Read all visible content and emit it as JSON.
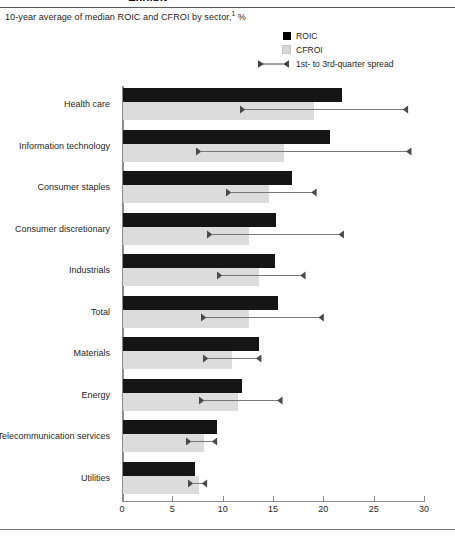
{
  "header": {
    "clipped_title": "Exhibit",
    "subtitle_text": "10-year average of median ROIC and CFROI by sector,",
    "subtitle_footnote": "1",
    "subtitle_unit": "%"
  },
  "legend": {
    "items": [
      {
        "label": "ROIC",
        "type": "swatch",
        "color": "#000000"
      },
      {
        "label": "CFROI",
        "type": "swatch",
        "color": "#d8d8d8"
      },
      {
        "label": "1st- to 3rd-quarter spread",
        "type": "spread"
      }
    ]
  },
  "axis": {
    "ticks": [
      "0",
      "5",
      "10",
      "15",
      "20",
      "25",
      "30"
    ]
  },
  "chart_data": {
    "type": "bar",
    "xlabel": "%",
    "ylabel": "",
    "xlim": [
      0,
      30
    ],
    "orientation": "horizontal",
    "grid": false,
    "legend_position": "top-right",
    "categories": [
      "Health care",
      "Information technology",
      "Consumer staples",
      "Consumer discretionary",
      "Industrials",
      "Total",
      "Materials",
      "Energy",
      "Telecommunication services",
      "Utilities"
    ],
    "series": [
      {
        "name": "ROIC",
        "color": "#151515",
        "values": [
          21.8,
          20.6,
          16.8,
          15.2,
          15.1,
          15.4,
          13.5,
          11.8,
          9.3,
          7.2
        ]
      },
      {
        "name": "CFROI",
        "color": "#dcdcdc",
        "values": [
          19.0,
          16.0,
          14.5,
          12.5,
          13.5,
          12.5,
          10.8,
          11.4,
          8.0,
          7.5
        ]
      }
    ],
    "spread": {
      "name": "1st- to 3rd-quarter spread",
      "low": [
        11.7,
        7.4,
        10.3,
        8.4,
        9.4,
        7.8,
        8.0,
        7.6,
        6.4,
        6.6
      ],
      "high": [
        28.4,
        28.8,
        19.3,
        22.0,
        18.2,
        20.0,
        13.8,
        15.9,
        9.5,
        8.5
      ]
    }
  }
}
